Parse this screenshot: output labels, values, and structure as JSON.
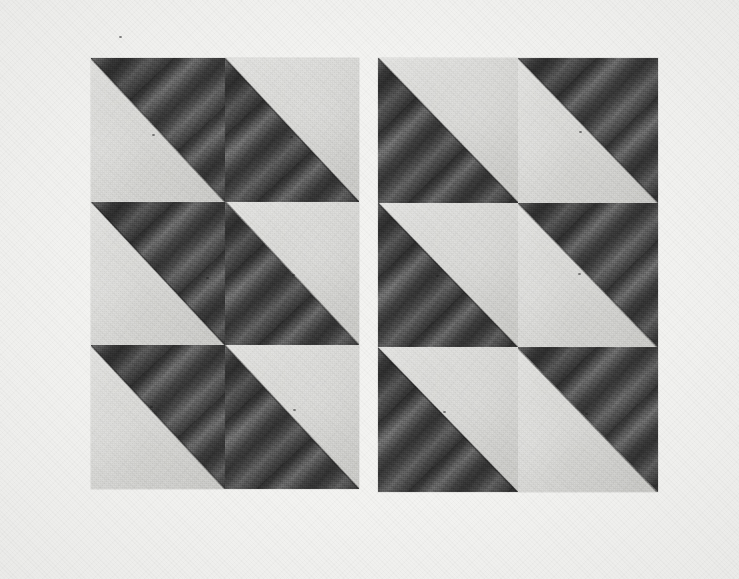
{
  "figure": {
    "caption": "",
    "background_color": "#f3f3f1",
    "width": 739,
    "height": 579
  },
  "palette": {
    "paper": "#f3f3f1",
    "light_region": "#d6d6d3",
    "mid_region": "#8d8d8d",
    "dark_region": "#3a3a3a",
    "darkest_band": "#2e2e2e",
    "edge_line": "#1a1a1a"
  },
  "panels": [
    {
      "name": "left-plate",
      "label": "Left plate",
      "x": 91,
      "y": 58,
      "width": 268,
      "height": 431,
      "columns": 2,
      "rows": 3,
      "tiles": [
        {
          "row": 0,
          "col": 0,
          "dark_half": "upper-right",
          "band_angle_deg": 132
        },
        {
          "row": 0,
          "col": 1,
          "dark_half": "lower-left",
          "band_angle_deg": 132
        },
        {
          "row": 1,
          "col": 0,
          "dark_half": "upper-right",
          "band_angle_deg": 132
        },
        {
          "row": 1,
          "col": 1,
          "dark_half": "lower-left",
          "band_angle_deg": 132
        },
        {
          "row": 2,
          "col": 0,
          "dark_half": "upper-right",
          "band_angle_deg": 132
        },
        {
          "row": 2,
          "col": 1,
          "dark_half": "lower-left",
          "band_angle_deg": 132
        }
      ]
    },
    {
      "name": "right-plate",
      "label": "Right plate",
      "x": 378,
      "y": 58,
      "width": 280,
      "height": 434,
      "columns": 2,
      "rows": 3,
      "tiles": [
        {
          "row": 0,
          "col": 0,
          "dark_half": "lower-left",
          "band_angle_deg": 132
        },
        {
          "row": 0,
          "col": 1,
          "dark_half": "upper-right",
          "band_angle_deg": 132
        },
        {
          "row": 1,
          "col": 0,
          "dark_half": "lower-left",
          "band_angle_deg": 132
        },
        {
          "row": 1,
          "col": 1,
          "dark_half": "upper-right",
          "band_angle_deg": 132
        },
        {
          "row": 2,
          "col": 0,
          "dark_half": "lower-left",
          "band_angle_deg": 132
        },
        {
          "row": 2,
          "col": 1,
          "dark_half": "upper-right",
          "band_angle_deg": 132
        }
      ]
    }
  ],
  "specks": [
    {
      "x": 152,
      "y": 134
    },
    {
      "x": 290,
      "y": 136
    },
    {
      "x": 206,
      "y": 277
    },
    {
      "x": 292,
      "y": 274
    },
    {
      "x": 150,
      "y": 406
    },
    {
      "x": 293,
      "y": 409
    },
    {
      "x": 579,
      "y": 131
    },
    {
      "x": 436,
      "y": 275
    },
    {
      "x": 578,
      "y": 273
    },
    {
      "x": 585,
      "y": 413
    },
    {
      "x": 443,
      "y": 411
    },
    {
      "x": 119,
      "y": 36
    }
  ]
}
